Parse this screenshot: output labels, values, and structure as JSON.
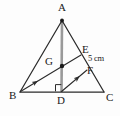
{
  "figure": {
    "background_color": "#fdfdfd",
    "stroke_color": "#2b2b2b",
    "median_color": "#7d7d7d"
  },
  "labels": {
    "a": "A",
    "b": "B",
    "c": "C",
    "d": "D",
    "e": "E",
    "f": "F",
    "g": "G",
    "measure_ef": "5 cm"
  },
  "points": {
    "A": {
      "x": 62,
      "y": 20,
      "label": "A"
    },
    "B": {
      "x": 20,
      "y": 92,
      "label": "B"
    },
    "C": {
      "x": 104,
      "y": 92,
      "label": "C"
    },
    "D": {
      "x": 61,
      "y": 92,
      "label": "D"
    },
    "E": {
      "x": 81,
      "y": 55,
      "label": "E"
    },
    "F": {
      "x": 87,
      "y": 70,
      "label": "F"
    },
    "G": {
      "x": 62,
      "y": 66,
      "label": "G"
    }
  },
  "segments": [
    {
      "name": "AB",
      "from": "A",
      "to": "B"
    },
    {
      "name": "AC",
      "from": "A",
      "to": "C"
    },
    {
      "name": "BC",
      "from": "B",
      "to": "C"
    },
    {
      "name": "AD",
      "from": "A",
      "to": "D"
    },
    {
      "name": "BE",
      "from": "B",
      "to": "E"
    },
    {
      "name": "DF",
      "from": "D",
      "to": "F"
    }
  ],
  "markers": {
    "right_angle_at": "D",
    "centroid_dot_at": "G",
    "vertex_dot_at": "A",
    "arrow_on": [
      "BE",
      "DF"
    ]
  }
}
